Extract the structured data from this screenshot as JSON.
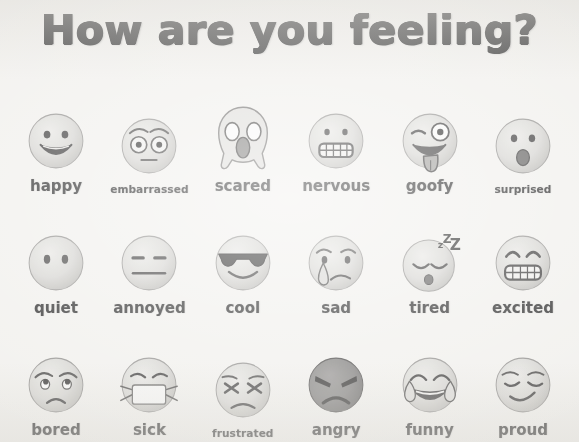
{
  "header": {
    "title": "How are you feeling?"
  },
  "colors": {
    "paper": "#f2f1ee",
    "ink": "#3a3a3a",
    "label_ink": "#414141",
    "face_yellow": "#d8d4c8",
    "face_yellow_light": "#e6e3d9",
    "face_dark_red": "#8f8a86",
    "feature_stroke": "#4a4846",
    "mask_white": "#f7f7f4"
  },
  "grid": {
    "columns": 6,
    "rows": 3
  },
  "emojis": [
    [
      {
        "label": "happy",
        "icon": "grinning-face-icon",
        "label_size": "normal"
      },
      {
        "label": "embarrassed",
        "icon": "flushed-face-icon",
        "label_size": "small"
      },
      {
        "label": "scared",
        "icon": "face-screaming-in-fear-icon",
        "label_size": "normal"
      },
      {
        "label": "nervous",
        "icon": "grimacing-face-icon",
        "label_size": "normal"
      },
      {
        "label": "goofy",
        "icon": "zany-face-icon",
        "label_size": "normal"
      },
      {
        "label": "surprised",
        "icon": "face-with-open-mouth-icon",
        "label_size": "small"
      }
    ],
    [
      {
        "label": "quiet",
        "icon": "face-without-mouth-icon",
        "label_size": "normal"
      },
      {
        "label": "annoyed",
        "icon": "expressionless-face-icon",
        "label_size": "normal"
      },
      {
        "label": "cool",
        "icon": "smiling-face-with-sunglasses-icon",
        "label_size": "normal"
      },
      {
        "label": "sad",
        "icon": "crying-face-icon",
        "label_size": "normal"
      },
      {
        "label": "tired",
        "icon": "sleeping-face-icon",
        "label_size": "normal"
      },
      {
        "label": "excited",
        "icon": "grinning-face-smiling-eyes-icon",
        "label_size": "normal"
      }
    ],
    [
      {
        "label": "bored",
        "icon": "face-with-rolling-eyes-icon",
        "label_size": "normal"
      },
      {
        "label": "sick",
        "icon": "face-with-medical-mask-icon",
        "label_size": "normal"
      },
      {
        "label": "frustrated",
        "icon": "confounded-face-icon",
        "label_size": "tiny"
      },
      {
        "label": "angry",
        "icon": "angry-face-icon",
        "label_size": "normal"
      },
      {
        "label": "funny",
        "icon": "face-with-tears-of-joy-icon",
        "label_size": "normal"
      },
      {
        "label": "proud",
        "icon": "smirking-face-icon",
        "label_size": "normal"
      }
    ]
  ]
}
